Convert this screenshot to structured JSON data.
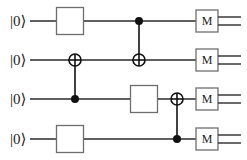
{
  "diagram": {
    "type": "quantum-circuit",
    "title": "",
    "qubit_count": 4,
    "wire_color": "#2b2b2b",
    "box_fill": "#ffffff",
    "box_stroke": "#6e6e6e",
    "node_color": "#111111",
    "background": "#ffffff",
    "qubits": [
      {
        "index": 1,
        "init_label": "|0⟩",
        "y": 21
      },
      {
        "index": 2,
        "init_label": "|0⟩",
        "y": 60
      },
      {
        "index": 3,
        "init_label": "|0⟩",
        "y": 99
      },
      {
        "index": 4,
        "init_label": "|0⟩",
        "y": 139
      }
    ],
    "wire": {
      "x_start": 30,
      "x_end": 207
    },
    "box_gates": [
      {
        "name": "gate-q1",
        "qubit": 1,
        "label": "",
        "cx": 70,
        "cy": 21,
        "w": 27,
        "h": 27
      },
      {
        "name": "gate-q3",
        "qubit": 3,
        "label": "",
        "cx": 144,
        "cy": 99,
        "w": 27,
        "h": 27
      },
      {
        "name": "gate-q4",
        "qubit": 4,
        "label": "",
        "cx": 70,
        "cy": 139,
        "w": 27,
        "h": 27
      }
    ],
    "cnots": [
      {
        "name": "cnot-control-q3-target-q2",
        "x": 75,
        "control_qubit": 3,
        "control_y": 99,
        "target_qubit": 2,
        "target_y": 60
      },
      {
        "name": "cnot-control-q1-target-q2",
        "x": 139,
        "control_qubit": 1,
        "control_y": 21,
        "target_qubit": 2,
        "target_y": 60
      },
      {
        "name": "cnot-control-q4-target-q3",
        "x": 177,
        "control_qubit": 4,
        "control_y": 139,
        "target_qubit": 3,
        "target_y": 99
      }
    ],
    "control_dot_radius": 4,
    "target_radius": 6,
    "measurements": [
      {
        "name": "measure-q1",
        "qubit": 1,
        "label": "M",
        "cx": 207,
        "cy": 21,
        "w": 22,
        "h": 22
      },
      {
        "name": "measure-q2",
        "qubit": 2,
        "label": "M",
        "cx": 207,
        "cy": 60,
        "w": 22,
        "h": 22
      },
      {
        "name": "measure-q3",
        "qubit": 3,
        "label": "M",
        "cx": 207,
        "cy": 99,
        "w": 22,
        "h": 22
      },
      {
        "name": "measure-q4",
        "qubit": 4,
        "label": "M",
        "cx": 207,
        "cy": 139,
        "w": 22,
        "h": 22
      }
    ],
    "classical_out": {
      "x_start": 218,
      "x_end": 241,
      "gap": 4
    }
  }
}
